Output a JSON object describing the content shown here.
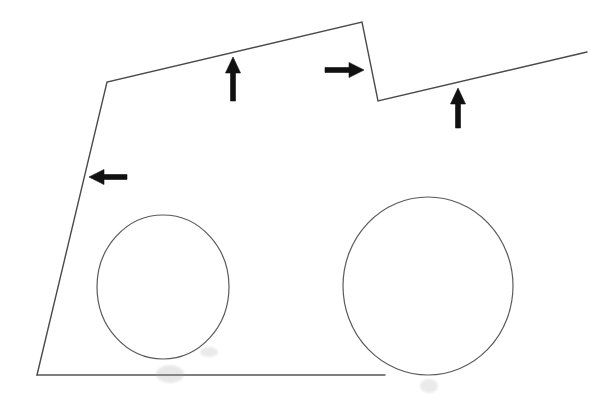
{
  "figure": {
    "title": "",
    "background_color": "#ffffff",
    "width": 614,
    "height": 400
  },
  "chart_data": {
    "type": "line",
    "title": "",
    "xlabel": "",
    "ylabel": "",
    "xlim": [
      0,
      614
    ],
    "ylim": [
      400,
      0
    ],
    "grid": false,
    "legend": null,
    "stroke_color": "#4a4a4a",
    "arrow_color": "#111111",
    "series": [
      {
        "name": "body-profile-polyline",
        "kind": "polyline",
        "color": "#4a4a4a",
        "width": 1.4,
        "closed": false,
        "points": [
          [
            37,
            375
          ],
          [
            107,
            82
          ],
          [
            362,
            22
          ],
          [
            378,
            101
          ],
          [
            587,
            52
          ]
        ]
      },
      {
        "name": "ground-line",
        "kind": "polyline",
        "color": "#555555",
        "width": 1.4,
        "closed": false,
        "points": [
          [
            37,
            375
          ],
          [
            385,
            375
          ]
        ]
      },
      {
        "name": "left-wheel-circle",
        "kind": "ellipse",
        "color": "#5a5a5a",
        "width": 1.2,
        "cx": 163,
        "cy": 287,
        "rx": 66,
        "ry": 72
      },
      {
        "name": "right-wheel-circle",
        "kind": "ellipse",
        "color": "#5a5a5a",
        "width": 1.2,
        "cx": 428,
        "cy": 286,
        "rx": 85,
        "ry": 89
      }
    ],
    "annotations": [
      {
        "name": "arrow-up-left-roof",
        "kind": "arrow",
        "direction": "up",
        "color": "#111111",
        "tail": [
          233,
          101
        ],
        "head": [
          233,
          57
        ],
        "shaft_width": 5,
        "head_width": 15,
        "head_length": 16,
        "label": ""
      },
      {
        "name": "arrow-right-notch",
        "kind": "arrow",
        "direction": "right",
        "color": "#111111",
        "tail": [
          325,
          70
        ],
        "head": [
          364,
          70
        ],
        "shaft_width": 5,
        "head_width": 15,
        "head_length": 15,
        "label": ""
      },
      {
        "name": "arrow-up-right-slope",
        "kind": "arrow",
        "direction": "up",
        "color": "#111111",
        "tail": [
          458,
          128
        ],
        "head": [
          458,
          88
        ],
        "shaft_width": 5,
        "head_width": 15,
        "head_length": 16,
        "label": ""
      },
      {
        "name": "arrow-left-front-face",
        "kind": "arrow",
        "direction": "left",
        "color": "#111111",
        "tail": [
          127,
          177
        ],
        "head": [
          89,
          177
        ],
        "shaft_width": 5,
        "head_width": 15,
        "head_length": 15,
        "label": ""
      }
    ],
    "smudges": [
      {
        "name": "smudge-under-left-wheel",
        "cx": 170,
        "cy": 374,
        "rx": 14,
        "ry": 9,
        "opacity": 0.22
      },
      {
        "name": "smudge-left-wheel-bottom-right",
        "cx": 209,
        "cy": 352,
        "rx": 9,
        "ry": 5,
        "opacity": 0.2
      },
      {
        "name": "smudge-under-right-wheel",
        "cx": 429,
        "cy": 386,
        "rx": 9,
        "ry": 7,
        "opacity": 0.2
      }
    ]
  }
}
